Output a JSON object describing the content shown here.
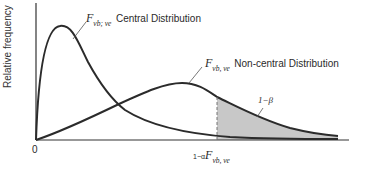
{
  "figure": {
    "y_axis_label": "Relative frequency",
    "x_origin_label": "0",
    "central": {
      "symbol": "F",
      "subscript": "νb; νe",
      "name": "Central Distribution"
    },
    "noncentral": {
      "symbol": "F",
      "subscript": "νb, νe",
      "name": "Non-central Distribution"
    },
    "power_label": "1−β",
    "critical_value": {
      "prefix": "1−α",
      "symbol": "F",
      "subscript": "νb, νe"
    },
    "colors": {
      "curve": "#2b2b2b",
      "shade": "#c8c8c8",
      "axis": "#333333"
    }
  }
}
